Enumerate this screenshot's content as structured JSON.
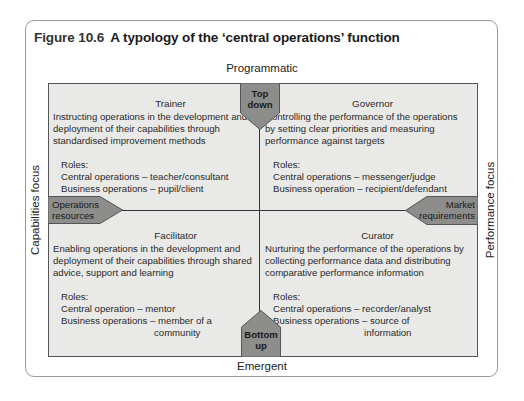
{
  "figure": {
    "number": "Figure 10.6",
    "title": "A typology of the ‘central operations’ function"
  },
  "axes": {
    "top": "Programmatic",
    "bottom": "Emergent",
    "left": "Capabilities focus",
    "right": "Performance focus"
  },
  "arrows": {
    "top": "Top down",
    "top_lines": [
      "Top",
      "down"
    ],
    "bottom_lines": [
      "Bottom",
      "up"
    ],
    "left_lines": [
      "Operations",
      "resources"
    ],
    "right_lines": [
      "Market",
      "requirements"
    ]
  },
  "quadrants": {
    "trainer": {
      "title": "Trainer",
      "description": "Instructing operations in the development and deployment of their capabilities through standardised improvement methods",
      "roles_label": "Roles:",
      "roles": [
        "Central operations – teacher/consultant",
        "Business operations – pupil/client"
      ]
    },
    "governor": {
      "title": "Governor",
      "description": "Controlling the performance of the operations by setting clear priorities and measuring performance against targets",
      "roles_label": "Roles:",
      "roles": [
        "Central operations – messenger/judge",
        "Business operation – recipient/defendant"
      ]
    },
    "facilitator": {
      "title": "Facilitator",
      "description": "Enabling operations in the development and deployment of their capabilities through shared advice, support and learning",
      "roles_label": "Roles:",
      "roles": [
        "Central operation – mentor",
        "Business operations – member of a",
        "community"
      ]
    },
    "curator": {
      "title": "Curator",
      "description": "Nurturing the performance of the operations by collecting performance data and distributing comparative performance information",
      "roles_label": "Roles:",
      "roles": [
        "Central operations – recorder/analyst",
        "Business operations – source of",
        "information"
      ]
    }
  },
  "colors": {
    "grid_fill": "#e9e9e7",
    "shape_fill": "#8d8d8b",
    "border": "#9a9a9a",
    "lines": "#333333"
  }
}
